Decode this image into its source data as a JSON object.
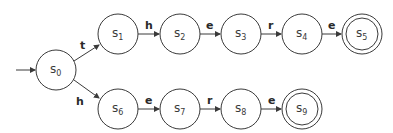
{
  "diagram": {
    "type": "finite-automaton",
    "start_state": "s0",
    "states": [
      {
        "id": "s0",
        "base": "s",
        "sub": "0",
        "cx": 56,
        "cy": 70,
        "accepting": false
      },
      {
        "id": "s1",
        "base": "s",
        "sub": "1",
        "cx": 118,
        "cy": 34,
        "accepting": false
      },
      {
        "id": "s2",
        "base": "s",
        "sub": "2",
        "cx": 180,
        "cy": 34,
        "accepting": false
      },
      {
        "id": "s3",
        "base": "s",
        "sub": "3",
        "cx": 241,
        "cy": 34,
        "accepting": false
      },
      {
        "id": "s4",
        "base": "s",
        "sub": "4",
        "cx": 302,
        "cy": 34,
        "accepting": false
      },
      {
        "id": "s5",
        "base": "s",
        "sub": "5",
        "cx": 362,
        "cy": 34,
        "accepting": true
      },
      {
        "id": "s6",
        "base": "s",
        "sub": "6",
        "cx": 118,
        "cy": 109,
        "accepting": false
      },
      {
        "id": "s7",
        "base": "s",
        "sub": "7",
        "cx": 180,
        "cy": 109,
        "accepting": false
      },
      {
        "id": "s8",
        "base": "s",
        "sub": "8",
        "cx": 241,
        "cy": 109,
        "accepting": false
      },
      {
        "id": "s9",
        "base": "s",
        "sub": "9",
        "cx": 302,
        "cy": 109,
        "accepting": true
      }
    ],
    "transitions": [
      {
        "from": "s0",
        "to": "s1",
        "label": "t"
      },
      {
        "from": "s1",
        "to": "s2",
        "label": "h"
      },
      {
        "from": "s2",
        "to": "s3",
        "label": "e"
      },
      {
        "from": "s3",
        "to": "s4",
        "label": "r"
      },
      {
        "from": "s4",
        "to": "s5",
        "label": "e"
      },
      {
        "from": "s0",
        "to": "s6",
        "label": "h"
      },
      {
        "from": "s6",
        "to": "s7",
        "label": "e"
      },
      {
        "from": "s7",
        "to": "s8",
        "label": "r"
      },
      {
        "from": "s8",
        "to": "s9",
        "label": "e"
      }
    ],
    "colors": {
      "stroke": "#3a3a3a",
      "fill": "#ffffff"
    }
  }
}
